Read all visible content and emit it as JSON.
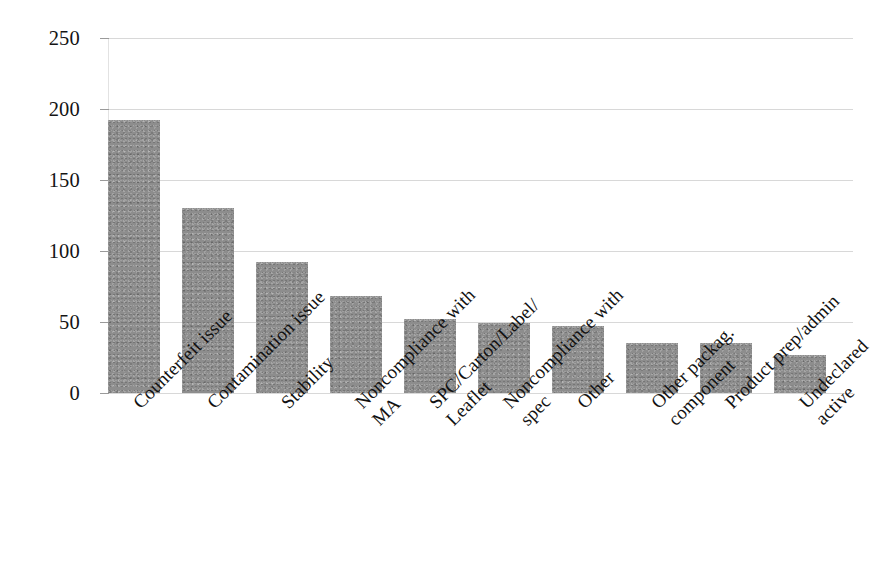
{
  "chart_data": {
    "type": "bar",
    "title": "",
    "subtitle": "",
    "xlabel": "",
    "ylabel": "",
    "ylim": [
      0,
      250
    ],
    "yticks": [
      0,
      50,
      100,
      150,
      200,
      250
    ],
    "grid": true,
    "legend": false,
    "legend_position": "none",
    "orientation": "vertical",
    "bar_color": "#8d8d8d",
    "gridline_color": "#d8d8d8",
    "background_color": "#ffffff",
    "categories": [
      "Counterfeit issue",
      "Contamination issue",
      "Stability",
      "Noncompliance with MA",
      "SPC/Carton/Label/ Leaflet",
      "Noncompliance with spec",
      "Other",
      "Other packag. component",
      "Product prep/admin",
      "Undeclared active"
    ],
    "category_lines": [
      [
        "Counterfeit issue"
      ],
      [
        "Contamination issue"
      ],
      [
        "Stability"
      ],
      [
        "Noncompliance with",
        "MA"
      ],
      [
        "SPC/Carton/Label/",
        "Leaflet"
      ],
      [
        "Noncompliance with",
        "spec"
      ],
      [
        "Other"
      ],
      [
        "Other packag.",
        "component"
      ],
      [
        "Product prep/admin"
      ],
      [
        "Undeclared active"
      ]
    ],
    "values": [
      192,
      130,
      92,
      68,
      52,
      49,
      47,
      35,
      35,
      27
    ]
  },
  "axis": {
    "y_tick_labels": [
      "0",
      "50",
      "100",
      "150",
      "200",
      "250"
    ]
  }
}
